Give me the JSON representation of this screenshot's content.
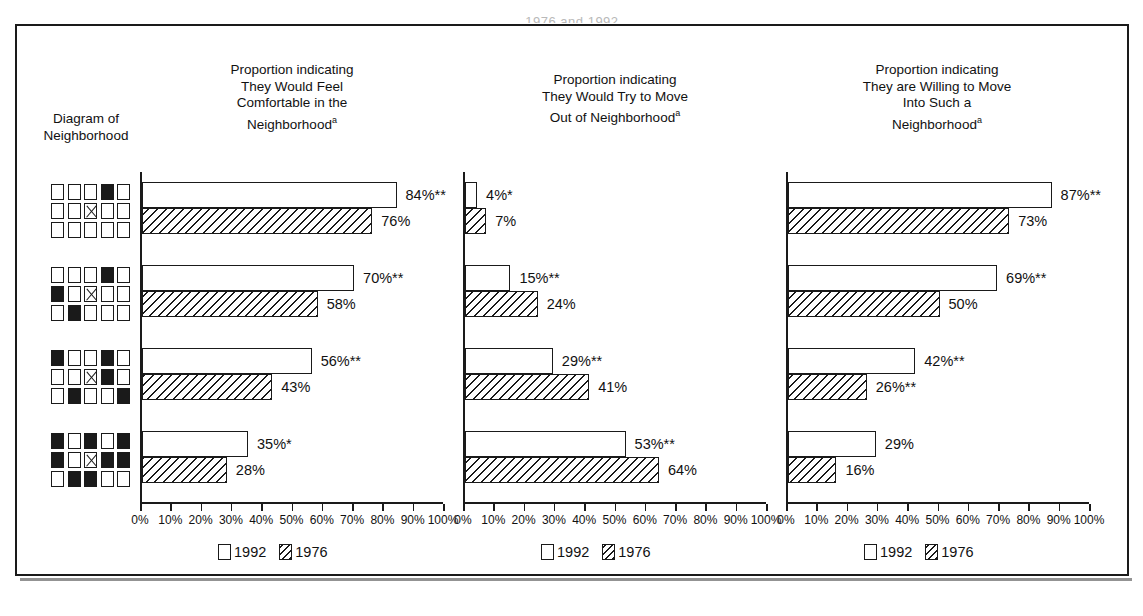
{
  "figure": {
    "clipped_top_title": "1976 and 1992.",
    "left_column_header": "Diagram of\nNeighborhood"
  },
  "legend": {
    "entries": [
      {
        "label": "1992",
        "pattern": "white"
      },
      {
        "label": "1976",
        "pattern": "hatched"
      }
    ]
  },
  "axis": {
    "ticks": [
      "0%",
      "10%",
      "20%",
      "30%",
      "40%",
      "50%",
      "60%",
      "70%",
      "80%",
      "90%",
      "100%"
    ],
    "min": 0,
    "max": 100
  },
  "neighborhoods": [
    {
      "name": "neighborhood-1",
      "grid": [
        [
          "empty",
          "empty",
          "empty",
          "filled",
          "empty"
        ],
        [
          "empty",
          "empty",
          "cross",
          "empty",
          "empty"
        ],
        [
          "empty",
          "empty",
          "empty",
          "empty",
          "empty"
        ]
      ]
    },
    {
      "name": "neighborhood-2",
      "grid": [
        [
          "empty",
          "empty",
          "empty",
          "filled",
          "empty"
        ],
        [
          "filled",
          "empty",
          "cross",
          "empty",
          "empty"
        ],
        [
          "empty",
          "filled",
          "empty",
          "empty",
          "empty"
        ]
      ]
    },
    {
      "name": "neighborhood-3",
      "grid": [
        [
          "filled",
          "empty",
          "empty",
          "filled",
          "empty"
        ],
        [
          "empty",
          "empty",
          "cross",
          "filled",
          "empty"
        ],
        [
          "empty",
          "filled",
          "empty",
          "empty",
          "filled"
        ]
      ]
    },
    {
      "name": "neighborhood-4",
      "grid": [
        [
          "filled",
          "empty",
          "filled",
          "empty",
          "filled"
        ],
        [
          "filled",
          "empty",
          "cross",
          "filled",
          "filled"
        ],
        [
          "empty",
          "filled",
          "filled",
          "empty",
          "empty"
        ]
      ]
    }
  ],
  "chart_data": [
    {
      "type": "bar",
      "title": "Proportion indicating\nThey Would Feel\nComfortable in the\nNeighborhood",
      "title_superscript": "a",
      "orientation": "horizontal",
      "xlabel": "",
      "ylabel": "",
      "xlim": [
        0,
        100
      ],
      "grid": false,
      "legend_position": "bottom",
      "categories": [
        "neighborhood-1",
        "neighborhood-2",
        "neighborhood-3",
        "neighborhood-4"
      ],
      "series": [
        {
          "name": "1992",
          "values": [
            84,
            70,
            56,
            35
          ],
          "labels": [
            "84%**",
            "70%**",
            "56%**",
            "35%*"
          ]
        },
        {
          "name": "1976",
          "values": [
            76,
            58,
            43,
            28
          ],
          "labels": [
            "76%",
            "58%",
            "43%",
            "28%"
          ]
        }
      ]
    },
    {
      "type": "bar",
      "title": "Proportion indicating\nThey Would Try to Move\nOut of Neighborhood",
      "title_superscript": "a",
      "orientation": "horizontal",
      "xlabel": "",
      "ylabel": "",
      "xlim": [
        0,
        100
      ],
      "grid": false,
      "legend_position": "bottom",
      "categories": [
        "neighborhood-1",
        "neighborhood-2",
        "neighborhood-3",
        "neighborhood-4"
      ],
      "series": [
        {
          "name": "1992",
          "values": [
            4,
            15,
            29,
            53
          ],
          "labels": [
            "4%*",
            "15%**",
            "29%**",
            "53%**"
          ]
        },
        {
          "name": "1976",
          "values": [
            7,
            24,
            41,
            64
          ],
          "labels": [
            "7%",
            "24%",
            "41%",
            "64%"
          ]
        }
      ]
    },
    {
      "type": "bar",
      "title": "Proportion indicating\nThey are Willing to Move\nInto Such a\nNeighborhood",
      "title_superscript": "a",
      "orientation": "horizontal",
      "xlabel": "",
      "ylabel": "",
      "xlim": [
        0,
        100
      ],
      "grid": false,
      "legend_position": "bottom",
      "categories": [
        "neighborhood-1",
        "neighborhood-2",
        "neighborhood-3",
        "neighborhood-4"
      ],
      "series": [
        {
          "name": "1992",
          "values": [
            87,
            69,
            42,
            29
          ],
          "labels": [
            "87%**",
            "69%**",
            "42%**",
            "29%"
          ]
        },
        {
          "name": "1976",
          "values": [
            73,
            50,
            26,
            16
          ],
          "labels": [
            "73%",
            "50%",
            "26%**",
            "16%"
          ]
        }
      ]
    }
  ]
}
